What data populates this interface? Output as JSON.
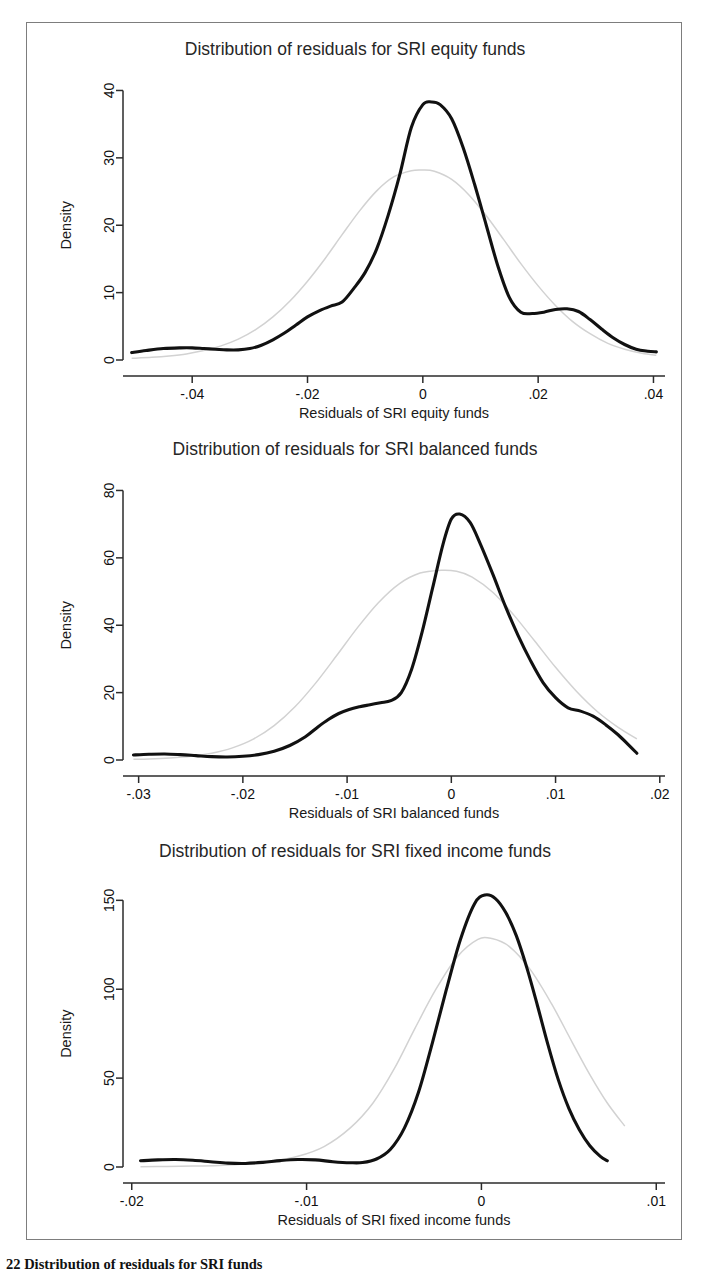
{
  "figure": {
    "caption": "22  Distribution of residuals for SRI funds",
    "border_color": "#7d7d7d",
    "background": "#ffffff"
  },
  "colors": {
    "kdensity_line": "#111111",
    "normal_line": "#d2d2d2",
    "axis": "#2b2b2b",
    "text": "#1a1a1a"
  },
  "chart_data": [
    {
      "type": "line",
      "title": "Distribution of residuals for SRI equity funds",
      "xlabel": "Residuals of SRI equity funds",
      "ylabel": "Density",
      "xlim": [
        -0.052,
        0.042
      ],
      "ylim": [
        0,
        42
      ],
      "xticks": [
        -0.04,
        -0.02,
        0,
        0.02,
        0.04
      ],
      "xticklabels": [
        "-.04",
        "-.02",
        "0",
        ".02",
        ".04"
      ],
      "yticks": [
        0,
        10,
        20,
        30,
        40
      ],
      "yticklabels": [
        "0",
        "10",
        "20",
        "30",
        "40"
      ],
      "grid": false,
      "legend": "none",
      "series": [
        {
          "name": "Kernel density",
          "style": "thick-black",
          "x": [
            -0.0505,
            -0.048,
            -0.045,
            -0.042,
            -0.04,
            -0.038,
            -0.036,
            -0.034,
            -0.032,
            -0.03,
            -0.028,
            -0.026,
            -0.024,
            -0.022,
            -0.02,
            -0.018,
            -0.016,
            -0.014,
            -0.012,
            -0.01,
            -0.008,
            -0.006,
            -0.004,
            -0.002,
            0.0,
            0.0015,
            0.003,
            0.005,
            0.007,
            0.009,
            0.011,
            0.013,
            0.015,
            0.017,
            0.019,
            0.021,
            0.023,
            0.025,
            0.027,
            0.029,
            0.031,
            0.033,
            0.035,
            0.037,
            0.039,
            0.0405
          ],
          "y": [
            1.1,
            1.4,
            1.7,
            1.8,
            1.8,
            1.7,
            1.6,
            1.5,
            1.5,
            1.7,
            2.2,
            3.0,
            4.0,
            5.2,
            6.4,
            7.3,
            8.0,
            8.6,
            10.6,
            13.0,
            16.5,
            21.5,
            27.5,
            34.5,
            37.9,
            38.3,
            37.9,
            35.8,
            31.5,
            26.0,
            20.0,
            14.0,
            9.3,
            7.1,
            6.9,
            7.1,
            7.5,
            7.6,
            7.2,
            6.0,
            4.6,
            3.3,
            2.3,
            1.6,
            1.3,
            1.2
          ]
        },
        {
          "name": "Normal density",
          "style": "thin-gray",
          "x": [
            -0.0505,
            -0.047,
            -0.044,
            -0.041,
            -0.038,
            -0.035,
            -0.032,
            -0.029,
            -0.026,
            -0.023,
            -0.02,
            -0.017,
            -0.014,
            -0.011,
            -0.008,
            -0.005,
            -0.002,
            0.0,
            0.002,
            0.005,
            0.008,
            0.011,
            0.014,
            0.017,
            0.02,
            0.023,
            0.026,
            0.029,
            0.032,
            0.035,
            0.038,
            0.0405
          ],
          "y": [
            0.25,
            0.4,
            0.6,
            0.9,
            1.4,
            2.1,
            3.1,
            4.5,
            6.4,
            8.8,
            11.7,
            15.0,
            18.6,
            22.1,
            25.1,
            27.2,
            28.1,
            28.2,
            28.0,
            26.8,
            24.5,
            21.4,
            17.9,
            14.3,
            11.0,
            8.1,
            5.7,
            3.9,
            2.5,
            1.6,
            1.0,
            0.7
          ]
        }
      ]
    },
    {
      "type": "line",
      "title": "Distribution of residuals for SRI balanced funds",
      "xlabel": "Residuals of SRI balanced funds",
      "ylabel": "Density",
      "xlim": [
        -0.0315,
        0.0205
      ],
      "ylim": [
        0,
        84
      ],
      "xticks": [
        -0.03,
        -0.02,
        -0.01,
        0,
        0.01,
        0.02
      ],
      "xticklabels": [
        "-.03",
        "-.02",
        "-.01",
        "0",
        ".01",
        ".02"
      ],
      "yticks": [
        0,
        20,
        40,
        60,
        80
      ],
      "yticklabels": [
        "0",
        "20",
        "40",
        "60",
        "80"
      ],
      "grid": false,
      "legend": "none",
      "series": [
        {
          "name": "Kernel density",
          "style": "thick-black",
          "x": [
            -0.0305,
            -0.029,
            -0.0275,
            -0.026,
            -0.0245,
            -0.023,
            -0.0215,
            -0.02,
            -0.0185,
            -0.017,
            -0.0155,
            -0.014,
            -0.0128,
            -0.0118,
            -0.0108,
            -0.0098,
            -0.0088,
            -0.0078,
            -0.0068,
            -0.0058,
            -0.0048,
            -0.0038,
            -0.0028,
            -0.0018,
            -0.0008,
            0.0,
            0.0008,
            0.0018,
            0.0028,
            0.004,
            0.0052,
            0.0064,
            0.0076,
            0.0088,
            0.01,
            0.0112,
            0.0124,
            0.0136,
            0.0148,
            0.016,
            0.017,
            0.0178
          ],
          "y": [
            1.5,
            1.7,
            1.8,
            1.6,
            1.3,
            1.0,
            0.9,
            1.1,
            1.6,
            2.6,
            4.3,
            6.9,
            9.8,
            12.0,
            13.8,
            15.0,
            15.8,
            16.4,
            17.0,
            17.6,
            20.0,
            27.0,
            38.0,
            51.0,
            64.0,
            71.5,
            73.0,
            70.5,
            64.0,
            55.0,
            45.5,
            37.0,
            29.5,
            23.0,
            18.5,
            15.5,
            14.5,
            13.0,
            10.5,
            7.5,
            4.5,
            2.0
          ]
        },
        {
          "name": "Normal density",
          "style": "thin-gray",
          "x": [
            -0.0305,
            -0.029,
            -0.027,
            -0.025,
            -0.023,
            -0.021,
            -0.019,
            -0.017,
            -0.015,
            -0.013,
            -0.011,
            -0.009,
            -0.007,
            -0.005,
            -0.003,
            -0.001,
            0.0005,
            0.002,
            0.004,
            0.006,
            0.008,
            0.01,
            0.012,
            0.014,
            0.016,
            0.0178
          ],
          "y": [
            0.2,
            0.3,
            0.6,
            1.1,
            2.0,
            3.6,
            6.2,
            10.2,
            15.8,
            22.9,
            31.0,
            39.3,
            46.7,
            52.3,
            55.5,
            56.3,
            56.0,
            54.3,
            49.7,
            43.0,
            35.3,
            27.5,
            20.4,
            14.4,
            9.7,
            6.3
          ]
        }
      ]
    },
    {
      "type": "line",
      "title": "Distribution of residuals for SRI fixed income funds",
      "xlabel": "Residuals of SRI fixed income funds",
      "ylabel": "Density",
      "xlim": [
        -0.0205,
        0.0105
      ],
      "ylim": [
        0,
        162
      ],
      "xticks": [
        -0.02,
        -0.01,
        0,
        0.01
      ],
      "xticklabels": [
        "-.02",
        "-.01",
        "0",
        ".01"
      ],
      "yticks": [
        0,
        50,
        100,
        150
      ],
      "yticklabels": [
        "0",
        "50",
        "100",
        "150"
      ],
      "grid": false,
      "legend": "none",
      "series": [
        {
          "name": "Kernel density",
          "style": "thick-black",
          "x": [
            -0.0195,
            -0.0185,
            -0.0175,
            -0.0165,
            -0.0155,
            -0.0145,
            -0.0135,
            -0.0125,
            -0.0115,
            -0.0105,
            -0.0095,
            -0.0085,
            -0.0075,
            -0.0068,
            -0.006,
            -0.0052,
            -0.0044,
            -0.0036,
            -0.0028,
            -0.002,
            -0.0012,
            -0.0004,
            0.0002,
            0.0008,
            0.0014,
            0.002,
            0.0026,
            0.0032,
            0.0038,
            0.0044,
            0.005,
            0.0056,
            0.0062,
            0.0068,
            0.0072
          ],
          "y": [
            3.5,
            4.0,
            4.2,
            3.8,
            3.0,
            2.2,
            2.0,
            2.6,
            3.6,
            4.2,
            4.0,
            3.0,
            2.4,
            2.5,
            4.5,
            10.0,
            22.0,
            42.0,
            70.0,
            100.0,
            128.0,
            148.0,
            153.0,
            151.0,
            143.0,
            130.0,
            112.0,
            91.0,
            69.0,
            49.0,
            33.0,
            21.0,
            12.0,
            6.0,
            3.5
          ]
        },
        {
          "name": "Normal density",
          "style": "thin-gray",
          "x": [
            -0.0195,
            -0.018,
            -0.0165,
            -0.015,
            -0.0135,
            -0.012,
            -0.0105,
            -0.009,
            -0.0075,
            -0.0062,
            -0.005,
            -0.0038,
            -0.0026,
            -0.0014,
            -0.0002,
            0.0006,
            0.0016,
            0.0028,
            0.004,
            0.0052,
            0.0062,
            0.0072,
            0.0082
          ],
          "y": [
            0.2,
            0.3,
            0.5,
            0.9,
            1.7,
            3.2,
            6.0,
            11.5,
            22.0,
            36.0,
            55.0,
            78.0,
            100.0,
            118.0,
            128.0,
            128.5,
            124.0,
            111.0,
            92.0,
            70.0,
            52.0,
            36.0,
            23.0
          ]
        }
      ]
    }
  ]
}
